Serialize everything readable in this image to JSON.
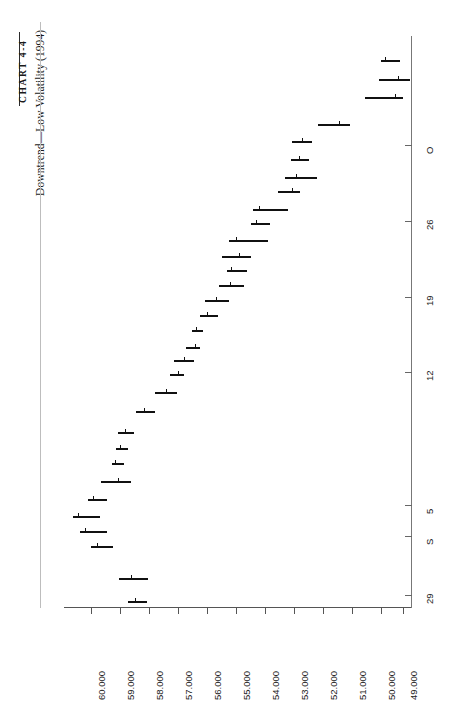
{
  "header": {
    "chart_label": "CHART 4-4",
    "subtitle": "Downtrend—Low Volatility (1994)"
  },
  "chart_data": {
    "type": "bar",
    "subtype": "hlc-price-bars-rotated",
    "title": "CHART 4-4",
    "subtitle": "Downtrend—Low Volatility (1994)",
    "orientation": "rotated-90",
    "xlabel": "",
    "ylabel": "",
    "price_axis": {
      "position": "bottom",
      "tick_labels": [
        "60.000",
        "59.000",
        "58.000",
        "57.000",
        "56.000",
        "55.000",
        "54.000",
        "53.000",
        "52.000",
        "51.000",
        "50.000",
        "49.000"
      ],
      "tick_values": [
        60.0,
        59.0,
        58.0,
        57.0,
        56.0,
        55.0,
        54.0,
        53.0,
        52.0,
        51.0,
        50.0,
        49.0
      ],
      "range": [
        60.5,
        48.5
      ],
      "direction": "decreasing-left-to-right"
    },
    "date_axis": {
      "position": "right",
      "tick_labels": [
        "O",
        "26",
        "19",
        "12",
        "5",
        "S",
        "29"
      ],
      "tick_pixel_y": [
        145,
        221,
        297,
        372,
        505,
        536,
        595
      ],
      "direction": "reverse-chronological-top-to-bottom"
    },
    "grid": false,
    "legend": false,
    "series": [
      {
        "name": "Price (High-Low-Close bars)",
        "bars": [
          {
            "high": 49.45,
            "low": 49.2,
            "close": 49.3
          },
          {
            "high": 49.8,
            "low": 49.35,
            "close": 49.55
          },
          {
            "high": 50.1,
            "low": 49.45,
            "close": 49.6
          },
          {
            "high": 50.95,
            "low": 50.45,
            "close": 50.6
          },
          {
            "high": 51.65,
            "low": 51.05,
            "close": 51.45
          },
          {
            "high": 51.6,
            "low": 51.25,
            "close": 51.35
          },
          {
            "high": 52.05,
            "low": 51.3,
            "close": 51.45
          },
          {
            "high": 52.15,
            "low": 51.7,
            "close": 51.95
          },
          {
            "high": 53.05,
            "low": 52.25,
            "close": 52.9
          },
          {
            "high": 53.1,
            "low": 52.7,
            "close": 52.95
          },
          {
            "high": 53.95,
            "low": 53.0,
            "close": 53.8
          },
          {
            "high": 54.35,
            "low": 53.6,
            "close": 53.95
          },
          {
            "high": 54.2,
            "low": 53.75,
            "close": 53.85
          },
          {
            "high": 54.55,
            "low": 54.15,
            "close": 54.35
          },
          {
            "high": 55.25,
            "low": 54.7,
            "close": 54.85
          },
          {
            "high": 55.4,
            "low": 55.0,
            "close": 55.1
          },
          {
            "high": 55.6,
            "low": 55.3,
            "close": 55.45
          },
          {
            "high": 55.95,
            "low": 55.55,
            "close": 55.7
          },
          {
            "high": 56.4,
            "low": 55.9,
            "close": 56.15
          },
          {
            "high": 56.4,
            "low": 56.15,
            "close": 56.25
          },
          {
            "high": 57.15,
            "low": 56.6,
            "close": 56.8
          },
          {
            "high": 57.75,
            "low": 57.3,
            "close": 57.55
          },
          {
            "high": 58.25,
            "low": 57.9,
            "close": 58.05
          },
          {
            "high": 58.35,
            "low": 58.05,
            "close": 58.15
          },
          {
            "high": 58.55,
            "low": 58.15,
            "close": 58.25
          },
          {
            "high": 59.2,
            "low": 58.65,
            "close": 58.9
          },
          {
            "high": 59.6,
            "low": 59.15,
            "close": 59.25
          },
          {
            "high": 60.15,
            "low": 59.65,
            "close": 59.8
          },
          {
            "high": 59.9,
            "low": 59.55,
            "close": 59.7
          },
          {
            "high": 59.45,
            "low": 59.05,
            "close": 59.2
          },
          {
            "high": 58.45,
            "low": 58.1,
            "close": 58.2
          },
          {
            "high": 58.2,
            "low": 58.05,
            "close": 58.1
          }
        ]
      }
    ]
  },
  "geometry": {
    "bars_pixels": [
      {
        "y": 60,
        "x1": 381,
        "x2": 400,
        "close_x": 385
      },
      {
        "y": 79,
        "x1": 379,
        "x2": 410,
        "close_x": 398
      },
      {
        "y": 97,
        "x1": 365,
        "x2": 403,
        "close_x": 395
      },
      {
        "y": 124,
        "x1": 318,
        "x2": 350,
        "close_x": 339
      },
      {
        "y": 141,
        "x1": 292,
        "x2": 312,
        "close_x": 302
      },
      {
        "y": 159,
        "x1": 291,
        "x2": 309,
        "close_x": 299
      },
      {
        "y": 177,
        "x1": 285,
        "x2": 317,
        "close_x": 296
      },
      {
        "y": 191,
        "x1": 278,
        "x2": 300,
        "close_x": 292
      },
      {
        "y": 209,
        "x1": 253,
        "x2": 288,
        "close_x": 259
      },
      {
        "y": 223,
        "x1": 251,
        "x2": 270,
        "close_x": 256
      },
      {
        "y": 240,
        "x1": 229,
        "x2": 268,
        "close_x": 236
      },
      {
        "y": 256,
        "x1": 222,
        "x2": 251,
        "close_x": 239
      },
      {
        "y": 270,
        "x1": 227,
        "x2": 247,
        "close_x": 231
      },
      {
        "y": 285,
        "x1": 219,
        "x2": 244,
        "close_x": 230
      },
      {
        "y": 300,
        "x1": 205,
        "x2": 229,
        "close_x": 216
      },
      {
        "y": 315,
        "x1": 200,
        "x2": 218,
        "close_x": 207
      },
      {
        "y": 330,
        "x1": 192,
        "x2": 203,
        "close_x": 196
      },
      {
        "y": 347,
        "x1": 186,
        "x2": 200,
        "close_x": 195
      },
      {
        "y": 360,
        "x1": 174,
        "x2": 194,
        "close_x": 184
      },
      {
        "y": 374,
        "x1": 170,
        "x2": 184,
        "close_x": 178
      },
      {
        "y": 392,
        "x1": 155,
        "x2": 177,
        "close_x": 166
      },
      {
        "y": 411,
        "x1": 136,
        "x2": 155,
        "close_x": 144
      },
      {
        "y": 432,
        "x1": 118,
        "x2": 134,
        "close_x": 125
      },
      {
        "y": 448,
        "x1": 116,
        "x2": 128,
        "close_x": 120
      },
      {
        "y": 463,
        "x1": 112,
        "x2": 124,
        "close_x": 115
      },
      {
        "y": 481,
        "x1": 101,
        "x2": 131,
        "close_x": 118
      },
      {
        "y": 499,
        "x1": 88,
        "x2": 107,
        "close_x": 93
      },
      {
        "y": 516,
        "x1": 73,
        "x2": 100,
        "close_x": 78
      },
      {
        "y": 531,
        "x1": 80,
        "x2": 107,
        "close_x": 85
      },
      {
        "y": 546,
        "x1": 91,
        "x2": 113,
        "close_x": 97
      },
      {
        "y": 578,
        "x1": 119,
        "x2": 148,
        "close_x": 131
      },
      {
        "y": 601,
        "x1": 128,
        "x2": 147,
        "close_x": 135
      }
    ],
    "price_tick_x": [
      91,
      120,
      149,
      178,
      207,
      236,
      265,
      294,
      323,
      352,
      381,
      403
    ],
    "price_label_x": [
      96,
      125,
      154,
      183,
      212,
      241,
      270,
      299,
      328,
      357,
      386,
      408
    ]
  }
}
